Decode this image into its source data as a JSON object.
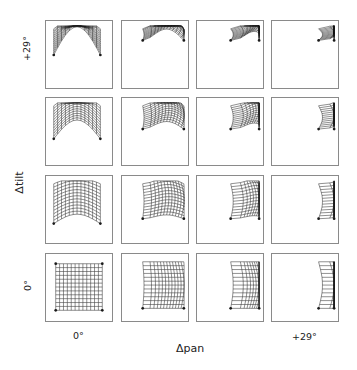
{
  "figure": {
    "x_axis_title": "Δpan",
    "y_axis_title": "Δtilt",
    "x_tick_labels": [
      {
        "col": 0,
        "text": "0°"
      },
      {
        "col": 3,
        "text": "+29°"
      }
    ],
    "y_tick_labels": [
      {
        "row": 0,
        "text": "+29°"
      },
      {
        "row": 3,
        "text": "0°"
      }
    ],
    "grid": {
      "rows": 4,
      "cols": 4
    },
    "line_color": "#1a1a1a",
    "frame_color": "#8a8a8a",
    "mesh_lines": 13
  },
  "panels": [
    {
      "row": 0,
      "col": 0,
      "desc": "arched mesh compressed near top, symmetric",
      "pan": 0,
      "tilt": 3
    },
    {
      "row": 0,
      "col": 1,
      "desc": "partial arched mesh, top-right",
      "pan": 1,
      "tilt": 3
    },
    {
      "row": 0,
      "col": 2,
      "desc": "small mesh fragment top-right",
      "pan": 2,
      "tilt": 3
    },
    {
      "row": 0,
      "col": 3,
      "desc": "tiny mesh fragment top-right",
      "pan": 3,
      "tilt": 3
    },
    {
      "row": 1,
      "col": 0,
      "desc": "arched mesh, symmetric",
      "pan": 0,
      "tilt": 2
    },
    {
      "row": 1,
      "col": 1,
      "desc": "arched mesh skewed right",
      "pan": 1,
      "tilt": 2
    },
    {
      "row": 1,
      "col": 2,
      "desc": "mesh compressed to right edge",
      "pan": 2,
      "tilt": 2
    },
    {
      "row": 1,
      "col": 3,
      "desc": "narrow mesh at right edge",
      "pan": 3,
      "tilt": 2
    },
    {
      "row": 2,
      "col": 0,
      "desc": "distorted near-square mesh",
      "pan": 0,
      "tilt": 1
    },
    {
      "row": 2,
      "col": 1,
      "desc": "barrel mesh pulled right",
      "pan": 1,
      "tilt": 1
    },
    {
      "row": 2,
      "col": 2,
      "desc": "curved mesh at right",
      "pan": 2,
      "tilt": 1
    },
    {
      "row": 2,
      "col": 3,
      "desc": "thin crescent mesh at right",
      "pan": 3,
      "tilt": 1
    },
    {
      "row": 3,
      "col": 0,
      "desc": "regular square grid",
      "pan": 0,
      "tilt": 0
    },
    {
      "row": 3,
      "col": 1,
      "desc": "pincushion mesh converging right",
      "pan": 1,
      "tilt": 0
    },
    {
      "row": 3,
      "col": 2,
      "desc": "crescent mesh converging right",
      "pan": 2,
      "tilt": 0
    },
    {
      "row": 3,
      "col": 3,
      "desc": "thin crescent at right edge",
      "pan": 3,
      "tilt": 0
    }
  ]
}
